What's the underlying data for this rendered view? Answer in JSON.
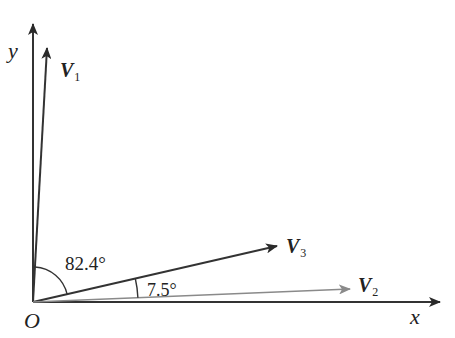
{
  "diagram": {
    "type": "vector-diagram",
    "origin": {
      "label": "O"
    },
    "axes": {
      "x_label": "x",
      "y_label": "y"
    },
    "vectors": [
      {
        "name": "V",
        "subscript": "1",
        "color": "#333333",
        "direction_deg_from_x": 82.4
      },
      {
        "name": "V",
        "subscript": "2",
        "color": "#888888",
        "direction_deg_from_x": 0
      },
      {
        "name": "V",
        "subscript": "3",
        "color": "#333333",
        "direction_deg_from_x": 7.5
      }
    ],
    "angles": [
      {
        "label": "82.4°",
        "between": [
          "V1",
          "V3"
        ]
      },
      {
        "label": "7.5°",
        "between": [
          "V3",
          "V2"
        ]
      }
    ]
  }
}
